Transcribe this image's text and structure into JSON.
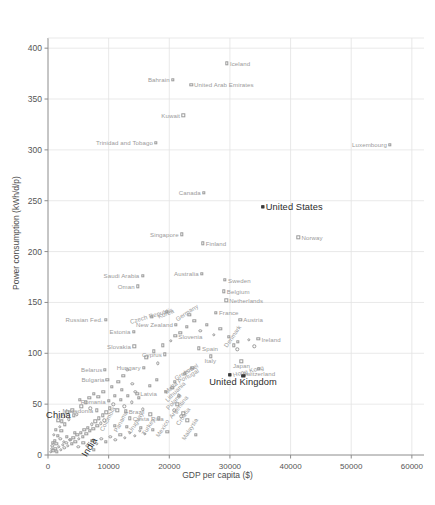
{
  "chart_data": {
    "type": "scatter",
    "title": "",
    "xlabel": "GDP per capita ($)",
    "ylabel": "Power consumption (kWh/d/p)",
    "xlim": [
      0,
      62000
    ],
    "ylim": [
      0,
      410
    ],
    "xticks": [
      "0",
      "10000",
      "20000",
      "30000",
      "40000",
      "50000",
      "60000"
    ],
    "xtick_values": [
      0,
      10000,
      20000,
      30000,
      40000,
      50000,
      60000
    ],
    "yticks": [
      "0",
      "50",
      "100",
      "150",
      "200",
      "250",
      "300",
      "350",
      "400"
    ],
    "ytick_values": [
      0,
      50,
      100,
      150,
      200,
      250,
      300,
      350,
      400
    ],
    "grid": true,
    "legend": "none",
    "marker_color": "#9a9a9a",
    "highlight_color": "#2b2b2b",
    "highlighted": [
      "United States",
      "United Kingdom",
      "China",
      "India",
      "Hong Kong"
    ],
    "points": [
      {
        "label": "Iceland",
        "x": 29500,
        "y": 385,
        "anchor": "right",
        "rot": 0
      },
      {
        "label": "Bahrain",
        "x": 20600,
        "y": 369,
        "anchor": "left",
        "rot": 0
      },
      {
        "label": "United Arab Emirates",
        "x": 23600,
        "y": 364,
        "anchor": "right",
        "rot": 0
      },
      {
        "label": "Kuwait",
        "x": 22300,
        "y": 334,
        "anchor": "left",
        "rot": 0
      },
      {
        "label": "Trinidad and Tobago",
        "x": 17800,
        "y": 307,
        "anchor": "left",
        "rot": 0
      },
      {
        "label": "Luxembourg",
        "x": 56400,
        "y": 305,
        "anchor": "left",
        "rot": 0
      },
      {
        "label": "Canada",
        "x": 25700,
        "y": 258,
        "anchor": "left",
        "rot": 0
      },
      {
        "label": "United States",
        "x": 35400,
        "y": 244,
        "anchor": "right",
        "rot": 0,
        "highlight": true,
        "filled": true
      },
      {
        "label": "Singapore",
        "x": 22100,
        "y": 217,
        "anchor": "left",
        "rot": 0
      },
      {
        "label": "Norway",
        "x": 41300,
        "y": 214,
        "anchor": "right",
        "rot": 0
      },
      {
        "label": "Finland",
        "x": 25500,
        "y": 208,
        "anchor": "right",
        "rot": 0
      },
      {
        "label": "Australia",
        "x": 25400,
        "y": 178,
        "anchor": "left",
        "rot": 0
      },
      {
        "label": "Sweden",
        "x": 29200,
        "y": 172,
        "anchor": "right",
        "rot": 0
      },
      {
        "label": "Saudi Arabia",
        "x": 15600,
        "y": 176,
        "anchor": "left",
        "rot": 0
      },
      {
        "label": "Oman",
        "x": 14800,
        "y": 166,
        "anchor": "left",
        "rot": 0
      },
      {
        "label": "Belgium",
        "x": 29000,
        "y": 161,
        "anchor": "right",
        "rot": 0
      },
      {
        "label": "Netherlands",
        "x": 29400,
        "y": 152,
        "anchor": "right",
        "rot": 0
      },
      {
        "label": "France",
        "x": 27700,
        "y": 140,
        "anchor": "right",
        "rot": 0
      },
      {
        "label": "Korea",
        "x": 19600,
        "y": 141,
        "anchor": "center",
        "rot": -22
      },
      {
        "label": "Germany",
        "x": 23300,
        "y": 138,
        "anchor": "center",
        "rot": -34
      },
      {
        "label": "Czech Republic",
        "x": 17100,
        "y": 136,
        "anchor": "center",
        "rot": -16
      },
      {
        "label": "Russian Fed.",
        "x": 9500,
        "y": 133,
        "anchor": "left",
        "rot": 0
      },
      {
        "label": "Austria",
        "x": 31700,
        "y": 133,
        "anchor": "right",
        "rot": 0
      },
      {
        "label": "New Zealand",
        "x": 21100,
        "y": 128,
        "anchor": "left",
        "rot": 0
      },
      {
        "label": "Estonia",
        "x": 14100,
        "y": 121,
        "anchor": "left",
        "rot": 0
      },
      {
        "label": "Slovenia",
        "x": 21000,
        "y": 117,
        "anchor": "right",
        "rot": 0
      },
      {
        "label": "Ireland",
        "x": 34700,
        "y": 114,
        "anchor": "right",
        "rot": 0
      },
      {
        "label": "Denmark",
        "x": 31300,
        "y": 111,
        "anchor": "center",
        "rot": -55
      },
      {
        "label": "Slovakia",
        "x": 14200,
        "y": 107,
        "anchor": "left",
        "rot": 0
      },
      {
        "label": "Spain",
        "x": 24900,
        "y": 105,
        "anchor": "right",
        "rot": 0
      },
      {
        "label": "Cyprus",
        "x": 19300,
        "y": 99,
        "anchor": "left",
        "rot": 0
      },
      {
        "label": "Italy",
        "x": 26800,
        "y": 97,
        "anchor": "center",
        "rot": 0
      },
      {
        "label": "Japan",
        "x": 31900,
        "y": 92,
        "anchor": "center",
        "rot": 0
      },
      {
        "label": "Switzerland",
        "x": 34800,
        "y": 85,
        "anchor": "center",
        "rot": 0
      },
      {
        "label": "United Kingdom",
        "x": 32200,
        "y": 78,
        "anchor": "center",
        "rot": 0,
        "highlight": true,
        "filled": true
      },
      {
        "label": "Hong Kong",
        "x": 30000,
        "y": 79,
        "anchor": "right",
        "rot": -14,
        "filled": true
      },
      {
        "label": "Israel",
        "x": 23800,
        "y": 86,
        "anchor": "center",
        "rot": -30
      },
      {
        "label": "Greece",
        "x": 22600,
        "y": 80,
        "anchor": "center",
        "rot": -33
      },
      {
        "label": "Hungary",
        "x": 15800,
        "y": 86,
        "anchor": "left",
        "rot": 0
      },
      {
        "label": "Belarus",
        "x": 9400,
        "y": 84,
        "anchor": "left",
        "rot": 0
      },
      {
        "label": "Bulgaria",
        "x": 9800,
        "y": 74,
        "anchor": "left",
        "rot": 0
      },
      {
        "label": "Portugal",
        "x": 20900,
        "y": 72,
        "anchor": "right",
        "rot": -30
      },
      {
        "label": "Malta",
        "x": 20500,
        "y": 66,
        "anchor": "center",
        "rot": -42
      },
      {
        "label": "Latvia",
        "x": 14700,
        "y": 60,
        "anchor": "right",
        "rot": 0
      },
      {
        "label": "Lithuania",
        "x": 21600,
        "y": 58,
        "anchor": "center",
        "rot": -45
      },
      {
        "label": "Romania",
        "x": 10000,
        "y": 53,
        "anchor": "left",
        "rot": 0
      },
      {
        "label": "Poland",
        "x": 21300,
        "y": 50,
        "anchor": "center",
        "rot": -48
      },
      {
        "label": "Macedonia",
        "x": 8000,
        "y": 44,
        "anchor": "left",
        "rot": 0
      },
      {
        "label": "Brazil",
        "x": 12800,
        "y": 43,
        "anchor": "right",
        "rot": 0
      },
      {
        "label": "Argentina",
        "x": 22300,
        "y": 41,
        "anchor": "center",
        "rot": -52
      },
      {
        "label": "Costa Rica",
        "x": 13500,
        "y": 36,
        "anchor": "right",
        "rot": 0
      },
      {
        "label": "Croatia",
        "x": 23000,
        "y": 34,
        "anchor": "center",
        "rot": -55
      },
      {
        "label": "Colombia",
        "x": 11000,
        "y": 29,
        "anchor": "center",
        "rot": -62
      },
      {
        "label": "Panama",
        "x": 13000,
        "y": 28,
        "anchor": "center",
        "rot": -62
      },
      {
        "label": "Uruguay",
        "x": 15300,
        "y": 27,
        "anchor": "center",
        "rot": -58
      },
      {
        "label": "Turkey",
        "x": 17300,
        "y": 25,
        "anchor": "center",
        "rot": -58
      },
      {
        "label": "Mexico",
        "x": 19700,
        "y": 23,
        "anchor": "center",
        "rot": -58
      },
      {
        "label": "Malaysia",
        "x": 24400,
        "y": 20,
        "anchor": "center",
        "rot": -58
      },
      {
        "label": "China",
        "x": 4300,
        "y": 39,
        "anchor": "left",
        "rot": 0,
        "highlight": true
      },
      {
        "label": "India",
        "x": 7600,
        "y": 5,
        "anchor": "center",
        "rot": -58,
        "highlight": true
      }
    ],
    "unlabeled_points": [
      {
        "x": 900,
        "y": 4
      },
      {
        "x": 1200,
        "y": 6
      },
      {
        "x": 1500,
        "y": 3
      },
      {
        "x": 1800,
        "y": 8
      },
      {
        "x": 2100,
        "y": 5
      },
      {
        "x": 2400,
        "y": 10
      },
      {
        "x": 2700,
        "y": 7
      },
      {
        "x": 3000,
        "y": 12
      },
      {
        "x": 3300,
        "y": 9
      },
      {
        "x": 3600,
        "y": 15
      },
      {
        "x": 3900,
        "y": 11
      },
      {
        "x": 4200,
        "y": 17
      },
      {
        "x": 4500,
        "y": 13
      },
      {
        "x": 4800,
        "y": 20
      },
      {
        "x": 5100,
        "y": 16
      },
      {
        "x": 5400,
        "y": 22
      },
      {
        "x": 5700,
        "y": 18
      },
      {
        "x": 6000,
        "y": 25
      },
      {
        "x": 6300,
        "y": 21
      },
      {
        "x": 6600,
        "y": 27
      },
      {
        "x": 6900,
        "y": 24
      },
      {
        "x": 7200,
        "y": 30
      },
      {
        "x": 7500,
        "y": 26
      },
      {
        "x": 7800,
        "y": 33
      },
      {
        "x": 8100,
        "y": 29
      },
      {
        "x": 8400,
        "y": 36
      },
      {
        "x": 8700,
        "y": 31
      },
      {
        "x": 9000,
        "y": 39
      },
      {
        "x": 9300,
        "y": 34
      },
      {
        "x": 9600,
        "y": 42
      },
      {
        "x": 10200,
        "y": 46
      },
      {
        "x": 10800,
        "y": 50
      },
      {
        "x": 11400,
        "y": 44
      },
      {
        "x": 12000,
        "y": 54
      },
      {
        "x": 12600,
        "y": 48
      },
      {
        "x": 13200,
        "y": 58
      },
      {
        "x": 13800,
        "y": 52
      },
      {
        "x": 14400,
        "y": 62
      },
      {
        "x": 15000,
        "y": 56
      },
      {
        "x": 5500,
        "y": 48
      },
      {
        "x": 6200,
        "y": 52
      },
      {
        "x": 7000,
        "y": 46
      },
      {
        "x": 8300,
        "y": 57
      },
      {
        "x": 9100,
        "y": 62
      },
      {
        "x": 10500,
        "y": 67
      },
      {
        "x": 11600,
        "y": 72
      },
      {
        "x": 12400,
        "y": 78
      },
      {
        "x": 13100,
        "y": 84
      },
      {
        "x": 4000,
        "y": 44
      },
      {
        "x": 4700,
        "y": 40
      },
      {
        "x": 3400,
        "y": 35
      },
      {
        "x": 2800,
        "y": 30
      },
      {
        "x": 2200,
        "y": 24
      },
      {
        "x": 1600,
        "y": 19
      },
      {
        "x": 16200,
        "y": 96
      },
      {
        "x": 17400,
        "y": 102
      },
      {
        "x": 18100,
        "y": 90
      },
      {
        "x": 18900,
        "y": 108
      },
      {
        "x": 20200,
        "y": 112
      },
      {
        "x": 21800,
        "y": 120
      },
      {
        "x": 22900,
        "y": 126
      },
      {
        "x": 24100,
        "y": 132
      },
      {
        "x": 25100,
        "y": 122
      },
      {
        "x": 26200,
        "y": 128
      },
      {
        "x": 27300,
        "y": 118
      },
      {
        "x": 28400,
        "y": 124
      },
      {
        "x": 29800,
        "y": 116
      },
      {
        "x": 30600,
        "y": 108
      },
      {
        "x": 31200,
        "y": 104
      },
      {
        "x": 33100,
        "y": 113
      },
      {
        "x": 34000,
        "y": 107
      },
      {
        "x": 5000,
        "y": 8
      },
      {
        "x": 5800,
        "y": 12
      },
      {
        "x": 6500,
        "y": 9
      },
      {
        "x": 7300,
        "y": 14
      },
      {
        "x": 8000,
        "y": 11
      },
      {
        "x": 8800,
        "y": 16
      },
      {
        "x": 9500,
        "y": 13
      },
      {
        "x": 10300,
        "y": 18
      },
      {
        "x": 11100,
        "y": 15
      },
      {
        "x": 11900,
        "y": 20
      },
      {
        "x": 12700,
        "y": 17
      },
      {
        "x": 13500,
        "y": 22
      },
      {
        "x": 14300,
        "y": 19
      },
      {
        "x": 15100,
        "y": 24
      },
      {
        "x": 16000,
        "y": 21
      },
      {
        "x": 1100,
        "y": 14
      },
      {
        "x": 1400,
        "y": 11
      },
      {
        "x": 2000,
        "y": 16
      },
      {
        "x": 2600,
        "y": 13
      },
      {
        "x": 3100,
        "y": 18
      },
      {
        "x": 3700,
        "y": 15
      },
      {
        "x": 4400,
        "y": 22
      },
      {
        "x": 700,
        "y": 9
      },
      {
        "x": 1000,
        "y": 20
      },
      {
        "x": 1300,
        "y": 25
      },
      {
        "x": 1900,
        "y": 28
      },
      {
        "x": 2300,
        "y": 33
      },
      {
        "x": 600,
        "y": 6
      },
      {
        "x": 800,
        "y": 12
      },
      {
        "x": 500,
        "y": 3
      },
      {
        "x": 1700,
        "y": 34
      },
      {
        "x": 2500,
        "y": 38
      },
      {
        "x": 3200,
        "y": 42
      },
      {
        "x": 6800,
        "y": 56
      },
      {
        "x": 7600,
        "y": 60
      },
      {
        "x": 5200,
        "y": 54
      },
      {
        "x": 16800,
        "y": 68
      },
      {
        "x": 17900,
        "y": 74
      },
      {
        "x": 19400,
        "y": 62
      },
      {
        "x": 15600,
        "y": 45
      },
      {
        "x": 16900,
        "y": 40
      },
      {
        "x": 18300,
        "y": 36
      },
      {
        "x": 20800,
        "y": 44
      },
      {
        "x": 22000,
        "y": 38
      },
      {
        "x": 12200,
        "y": 64
      },
      {
        "x": 13900,
        "y": 70
      },
      {
        "x": 11000,
        "y": 58
      }
    ]
  }
}
